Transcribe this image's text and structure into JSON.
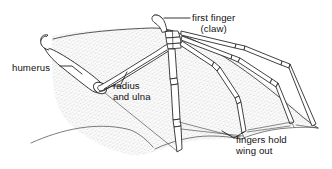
{
  "figure": {
    "background_color": "#ffffff",
    "line_color": "#2b2b2b",
    "membrane_fill_color": "#f4f4f4",
    "stipple_color": "#a8a8a8",
    "text_color": "#111111"
  },
  "labels": {
    "humerus": {
      "line1": "humerus"
    },
    "radius_ulna": {
      "line1": "radius",
      "line2": "and ulna"
    },
    "first_finger": {
      "line1": "first finger",
      "line2": "(claw)"
    },
    "fingers_hold": {
      "line1": "fingers hold",
      "line2": "wing out"
    }
  },
  "parts": {
    "humerus": "humerus-bone",
    "radius_ulna": "radius-and-ulna-bone",
    "carpals": "wrist-carpal-bones",
    "first_finger_claw": "first-finger-claw-bone",
    "finger_two": "second-finger-bone",
    "finger_three": "third-finger-bone",
    "finger_four": "fourth-finger-bone",
    "finger_five": "fifth-finger-bone",
    "membrane": "wing-membrane"
  }
}
